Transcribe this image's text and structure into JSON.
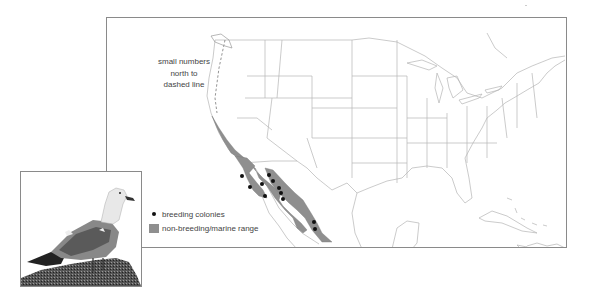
{
  "map": {
    "annotation": [
      "small numbers",
      "north to",
      "dashed line"
    ],
    "legend": [
      {
        "symbol": "dot",
        "label": "breeding colonies",
        "color": "#111111"
      },
      {
        "symbol": "swatch",
        "label": "non-breeding/marine range",
        "color": "#8f8f8f"
      }
    ],
    "colors": {
      "range": "#8f8f8f",
      "border": "#8a8a8a",
      "outline": "#b0b0b0",
      "colony": "#111111"
    }
  },
  "photo": {
    "subject": "gull standing on rock"
  }
}
